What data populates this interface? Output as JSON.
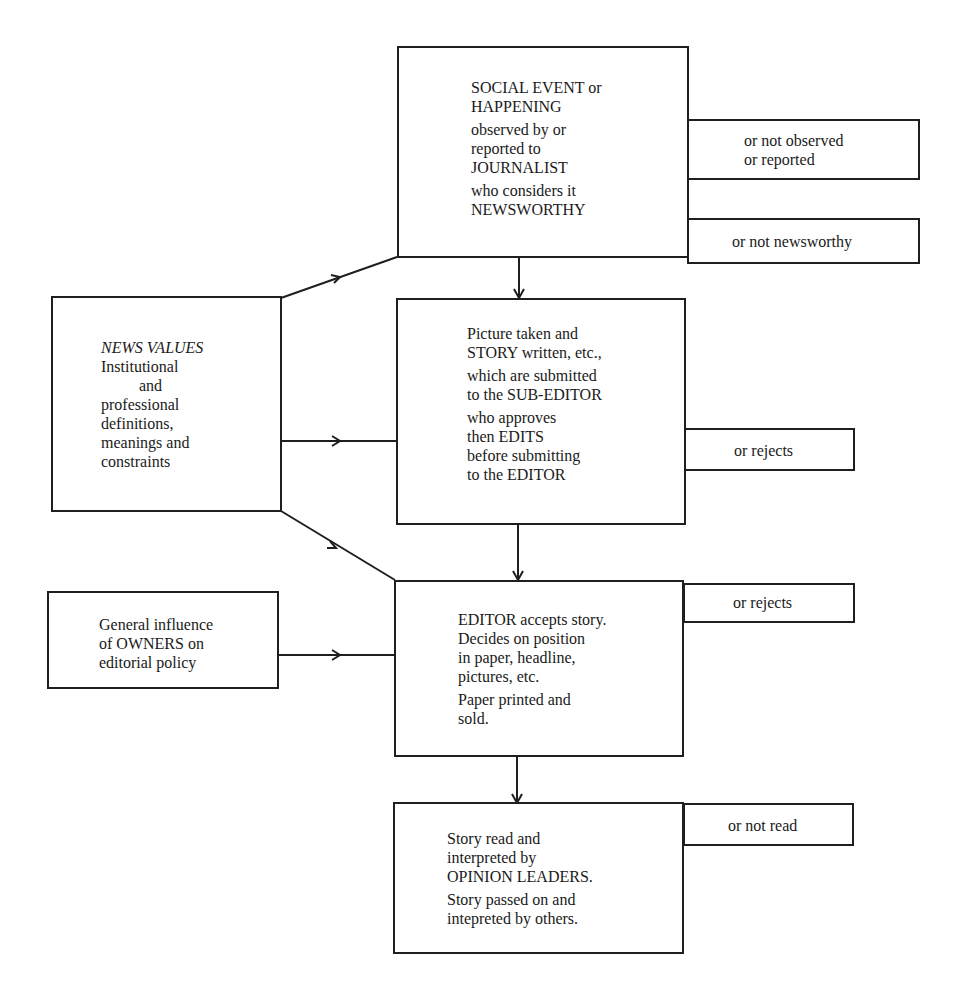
{
  "diagram": {
    "main_flow": [
      {
        "id": "social-event",
        "groups": [
          [
            "SOCIAL EVENT or",
            "HAPPENING"
          ],
          [
            "observed by or",
            "reported to",
            "JOURNALIST"
          ],
          [
            "who considers it",
            "NEWSWORTHY"
          ]
        ]
      },
      {
        "id": "sub-editor",
        "groups": [
          [
            "Picture taken and",
            "STORY written, etc.,"
          ],
          [
            "which are submitted",
            "to the SUB-EDITOR"
          ],
          [
            "who approves",
            "then EDITS",
            "before submitting",
            "to the EDITOR"
          ]
        ]
      },
      {
        "id": "editor",
        "groups": [
          [
            "EDITOR accepts story.",
            "Decides on position",
            "in paper, headline,",
            "pictures, etc."
          ],
          [
            "Paper printed and",
            "sold."
          ]
        ]
      },
      {
        "id": "opinion-leaders",
        "groups": [
          [
            "Story read and",
            "interpreted by",
            "OPINION LEADERS."
          ],
          [
            "Story passed on and",
            "intepreted by others."
          ]
        ]
      }
    ],
    "side_outcomes": [
      {
        "id": "not-observed",
        "lines": [
          "or not observed",
          "or reported"
        ]
      },
      {
        "id": "not-newsworthy",
        "lines": [
          "or not newsworthy"
        ]
      },
      {
        "id": "sub-editor-rejects",
        "lines": [
          "or rejects"
        ]
      },
      {
        "id": "editor-rejects",
        "lines": [
          "or rejects"
        ]
      },
      {
        "id": "not-read",
        "lines": [
          "or not read"
        ]
      }
    ],
    "influences": [
      {
        "id": "news-values",
        "title": "NEWS VALUES",
        "lines": [
          "Institutional",
          "and",
          "professional",
          "definitions,",
          "meanings and",
          "constraints"
        ]
      },
      {
        "id": "owners",
        "lines": [
          "General influence",
          "of OWNERS on",
          "editorial policy"
        ]
      }
    ],
    "colors": {
      "line": "#1f1f1f",
      "text": "#1a1a1a",
      "background": "#ffffff"
    }
  }
}
